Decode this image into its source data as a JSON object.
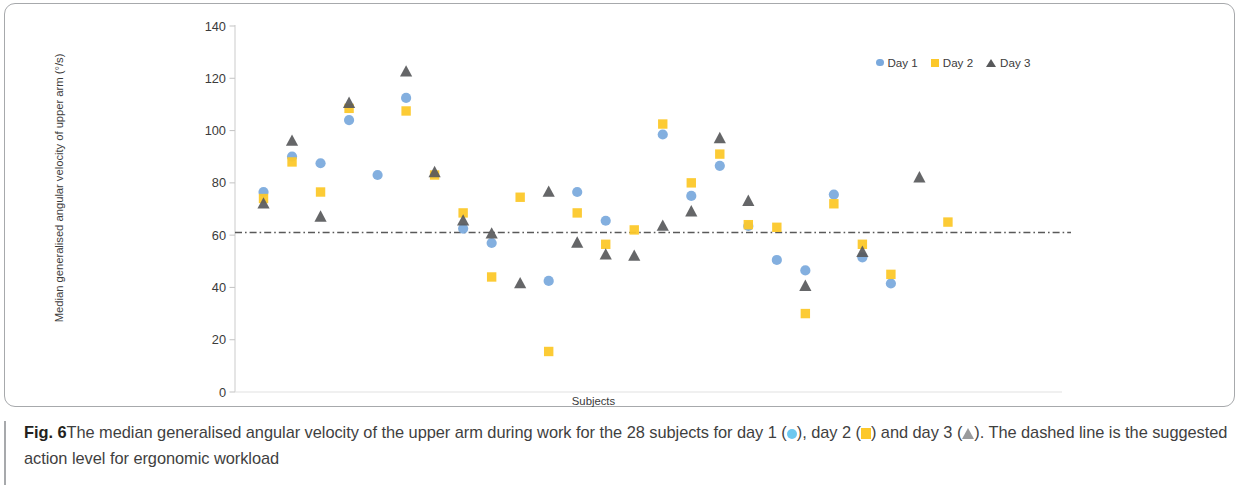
{
  "figure": {
    "label": "Fig. 6",
    "caption_part_1": "The median generalised angular velocity of the upper arm during work for the 28 subjects for day 1 (",
    "caption_part_2": "), day 2 (",
    "caption_part_3": ") and day 3 (",
    "caption_part_4": "). The dashed line is the suggested action level for ergonomic workload"
  },
  "legend": {
    "items": [
      {
        "label": "Day 1",
        "marker": "circle-icon",
        "color": "#7aa9dd"
      },
      {
        "label": "Day 2",
        "marker": "square-icon",
        "color": "#fcc82a"
      },
      {
        "label": "Day 3",
        "marker": "triangle-icon",
        "color": "#58595b"
      }
    ]
  },
  "chart_data": {
    "type": "scatter",
    "title": "",
    "xlabel": "Subjects",
    "ylabel": "Median generalised angular velocity of upper arm (°/s)",
    "ylim": [
      0,
      140
    ],
    "yticks": [
      0,
      20,
      40,
      60,
      80,
      100,
      120,
      140
    ],
    "xlim": [
      0,
      29
    ],
    "grid": false,
    "x": [
      1,
      2,
      3,
      4,
      5,
      6,
      7,
      8,
      9,
      10,
      11,
      12,
      13,
      14,
      15,
      16,
      17,
      18,
      19,
      20,
      21,
      22,
      23,
      24,
      25,
      26,
      27,
      28
    ],
    "categories": [
      "1",
      "2",
      "3",
      "4",
      "5",
      "6",
      "7",
      "8",
      "9",
      "10",
      "11",
      "12",
      "13",
      "14",
      "15",
      "16",
      "17",
      "18",
      "19",
      "20",
      "21",
      "22",
      "23",
      "24",
      "25",
      "26",
      "27",
      "28"
    ],
    "series": [
      {
        "name": "Day 1",
        "marker": "circle",
        "color": "#7aa9dd",
        "values": [
          76.5,
          90.0,
          87.5,
          104.0,
          83.0,
          112.5,
          null,
          62.5,
          57.0,
          null,
          42.5,
          76.5,
          65.5,
          null,
          98.5,
          75.0,
          86.5,
          63.5,
          50.5,
          46.5,
          75.5,
          51.5,
          41.5,
          null,
          null,
          null,
          null,
          null
        ]
      },
      {
        "name": "Day 2",
        "marker": "square",
        "color": "#fcc82a",
        "values": [
          74.0,
          88.0,
          76.5,
          108.5,
          null,
          107.5,
          83.0,
          68.5,
          44.0,
          74.5,
          15.5,
          68.5,
          56.5,
          62.0,
          102.5,
          80.0,
          91.0,
          64.0,
          63.0,
          30.0,
          72.0,
          56.5,
          45.0,
          null,
          65.0,
          null,
          null,
          null
        ]
      },
      {
        "name": "Day 3",
        "marker": "triangle",
        "color": "#58595b",
        "values": [
          72.0,
          96.0,
          67.0,
          110.5,
          null,
          122.5,
          84.0,
          65.5,
          60.5,
          41.5,
          76.5,
          57.0,
          52.5,
          52.0,
          63.5,
          69.0,
          97.0,
          73.0,
          null,
          40.5,
          null,
          53.5,
          null,
          82.0,
          null,
          null,
          null,
          null
        ]
      }
    ],
    "reference_line": {
      "name": "Suggested action level for ergonomic workload",
      "value": 61,
      "style": "dash-dot",
      "color": "#595959"
    }
  },
  "points": {
    "day1": [
      {
        "x": 1,
        "y": 76.5
      },
      {
        "x": 2,
        "y": 90.0
      },
      {
        "x": 3,
        "y": 87.5
      },
      {
        "x": 4,
        "y": 104.0
      },
      {
        "x": 5,
        "y": 83.0
      },
      {
        "x": 6,
        "y": 112.5
      },
      {
        "x": 8,
        "y": 62.5
      },
      {
        "x": 9,
        "y": 57.0
      },
      {
        "x": 11,
        "y": 42.5
      },
      {
        "x": 12,
        "y": 76.5
      },
      {
        "x": 13,
        "y": 65.5
      },
      {
        "x": 15,
        "y": 98.5
      },
      {
        "x": 16,
        "y": 75.0
      },
      {
        "x": 17,
        "y": 86.5
      },
      {
        "x": 18,
        "y": 63.5
      },
      {
        "x": 19,
        "y": 50.5
      },
      {
        "x": 20,
        "y": 46.5
      },
      {
        "x": 21,
        "y": 75.5
      },
      {
        "x": 22,
        "y": 51.5
      },
      {
        "x": 23,
        "y": 41.5
      },
      {
        "x": 10,
        "y": 36.5
      }
    ],
    "day2": [
      {
        "x": 1,
        "y": 74.0
      },
      {
        "x": 2,
        "y": 88.0
      },
      {
        "x": 3,
        "y": 76.5
      },
      {
        "x": 4,
        "y": 108.5
      },
      {
        "x": 6,
        "y": 107.5
      },
      {
        "x": 7,
        "y": 83.0
      },
      {
        "x": 8,
        "y": 68.5
      },
      {
        "x": 9,
        "y": 44.0
      },
      {
        "x": 10,
        "y": 74.5
      },
      {
        "x": 11,
        "y": 15.5
      },
      {
        "x": 12,
        "y": 68.5
      },
      {
        "x": 13,
        "y": 56.5
      },
      {
        "x": 14,
        "y": 62.0
      },
      {
        "x": 15,
        "y": 102.5
      },
      {
        "x": 16,
        "y": 80.0
      },
      {
        "x": 17,
        "y": 91.0
      },
      {
        "x": 18,
        "y": 64.0
      },
      {
        "x": 19,
        "y": 63.0
      },
      {
        "x": 20,
        "y": 30.0
      },
      {
        "x": 21,
        "y": 72.0
      },
      {
        "x": 22,
        "y": 56.5
      },
      {
        "x": 23,
        "y": 45.0
      },
      {
        "x": 25,
        "y": 65.0
      }
    ],
    "day3": [
      {
        "x": 1,
        "y": 72.0
      },
      {
        "x": 2,
        "y": 96.0
      },
      {
        "x": 3,
        "y": 67.0
      },
      {
        "x": 4,
        "y": 110.5
      },
      {
        "x": 6,
        "y": 122.5
      },
      {
        "x": 7,
        "y": 84.0
      },
      {
        "x": 8,
        "y": 65.5
      },
      {
        "x": 9,
        "y": 60.5
      },
      {
        "x": 10,
        "y": 41.5
      },
      {
        "x": 11,
        "y": 76.5
      },
      {
        "x": 12,
        "y": 57.0
      },
      {
        "x": 13,
        "y": 52.5
      },
      {
        "x": 14,
        "y": 52.0
      },
      {
        "x": 15,
        "y": 63.5
      },
      {
        "x": 16,
        "y": 69.0
      },
      {
        "x": 17,
        "y": 97.0
      },
      {
        "x": 18,
        "y": 73.0
      },
      {
        "x": 20,
        "y": 40.5
      },
      {
        "x": 22,
        "y": 53.5
      },
      {
        "x": 24,
        "y": 82.0
      }
    ]
  }
}
